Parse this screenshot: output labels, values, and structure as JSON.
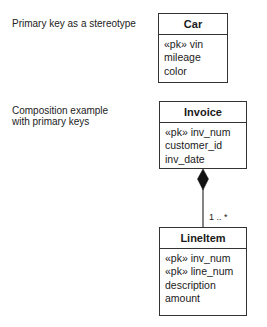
{
  "captions": {
    "stereotype": "Primary key as a stereotype",
    "composition_line1": "Composition example",
    "composition_line2": "with primary keys"
  },
  "classes": {
    "car": {
      "name": "Car",
      "attributes": [
        "«pk» vin",
        "mileage",
        "color"
      ]
    },
    "invoice": {
      "name": "Invoice",
      "attributes": [
        "«pk» inv_num",
        "customer_id",
        "inv_date"
      ]
    },
    "lineitem": {
      "name": "LineItem",
      "attributes": [
        "«pk» inv_num",
        "«pk» line_num",
        "description",
        "amount"
      ]
    }
  },
  "association": {
    "type": "composition",
    "from": "Invoice",
    "to": "LineItem",
    "multiplicity": "1 .. *",
    "colors": {
      "line": "#333333",
      "diamond": "#111111"
    }
  }
}
